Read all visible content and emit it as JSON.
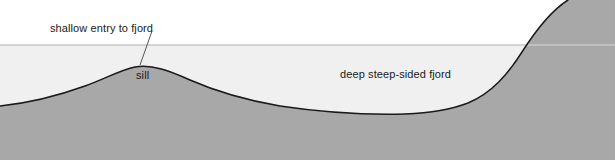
{
  "diagram": {
    "labels": {
      "shallow_entry": "shallow entry to fjord",
      "sill": "sill",
      "deep_fjord": "deep steep-sided fjord"
    },
    "colors": {
      "background": "#ffffff",
      "water_fill": "#f0f0f0",
      "water_surface_line": "#c8c8c8",
      "land_fill": "#a8a8a8",
      "land_outline": "#1a1a1a",
      "label_text": "#1a1a1a",
      "leader_line": "#555555"
    },
    "geometry": {
      "water_surface_y": 45,
      "sill_peak": {
        "x": 135,
        "y": 67
      },
      "basin_floor_y": 114,
      "right_slope_exit_x": 585
    }
  }
}
